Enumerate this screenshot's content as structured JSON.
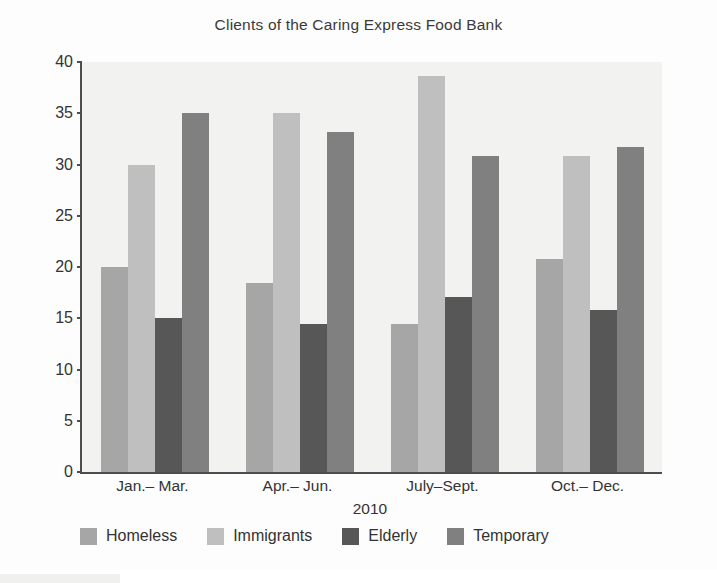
{
  "chart_data": {
    "type": "bar",
    "title": "Clients of the Caring Express Food Bank",
    "xlabel": "2010",
    "ylabel": "Percentage of Total Number",
    "categories": [
      "Jan.– Mar.",
      "Apr.– Jun.",
      "July–Sept.",
      "Oct.– Dec."
    ],
    "series": [
      {
        "name": "Homeless",
        "color": "#a6a6a6",
        "values": [
          20.0,
          18.4,
          14.4,
          20.8
        ]
      },
      {
        "name": "Immigrants",
        "color": "#bfbfbf",
        "values": [
          30.0,
          35.0,
          38.6,
          30.8
        ]
      },
      {
        "name": "Elderly",
        "color": "#575757",
        "values": [
          15.0,
          14.4,
          17.1,
          15.8
        ]
      },
      {
        "name": "Temporary",
        "color": "#808080",
        "values": [
          35.0,
          33.2,
          30.8,
          31.7
        ]
      }
    ],
    "ylim": [
      0,
      40
    ],
    "yticks": [
      0,
      5,
      10,
      15,
      20,
      25,
      30,
      35,
      40
    ],
    "grid": false,
    "legend_position": "bottom",
    "plot_background": "#f2f2f0",
    "axis_color": "#4d4d4d"
  }
}
